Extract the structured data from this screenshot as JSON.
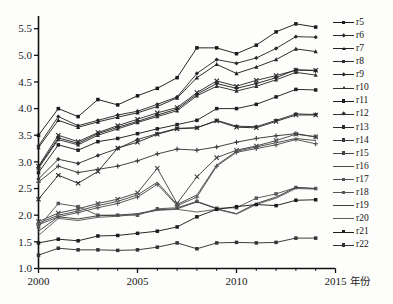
{
  "chart_data": {
    "type": "line",
    "title": "",
    "xlabel": "年份",
    "ylabel": "",
    "xlim": [
      2000,
      2015
    ],
    "ylim": [
      1.0,
      5.7
    ],
    "grid": false,
    "legend_position": "right",
    "x_ticks": [
      2000,
      2005,
      2010,
      2015
    ],
    "x_tick_labels": [
      "2000",
      "2005",
      "2010",
      "2015"
    ],
    "x_minor_ticks": [
      2001,
      2002,
      2003,
      2004,
      2006,
      2007,
      2008,
      2009,
      2011,
      2012,
      2013,
      2014
    ],
    "y_ticks": [
      1.0,
      1.5,
      2.0,
      2.5,
      3.0,
      3.5,
      4.0,
      4.5,
      5.0,
      5.5
    ],
    "y_tick_labels": [
      "1.0",
      "1.5",
      "2.0",
      "2.5",
      "3.0",
      "3.5",
      "4.0",
      "4.5",
      "5.0",
      "5.5"
    ],
    "x": [
      2000,
      2001,
      2002,
      2003,
      2004,
      2005,
      2006,
      2007,
      2008,
      2009,
      2010,
      2011,
      2012,
      2013,
      2014
    ],
    "series": [
      {
        "name": "r5",
        "color": "#1a1a1a",
        "marker": "square",
        "values": [
          3.5,
          4.0,
          3.85,
          4.17,
          4.07,
          4.24,
          4.38,
          4.58,
          5.14,
          5.14,
          5.03,
          5.19,
          5.44,
          5.59,
          5.53
        ]
      },
      {
        "name": "r6",
        "color": "#2b2b2b",
        "marker": "diamond",
        "values": [
          3.3,
          3.85,
          3.68,
          3.78,
          3.88,
          3.95,
          4.08,
          4.22,
          4.66,
          4.92,
          4.85,
          4.95,
          5.13,
          5.35,
          5.34
        ]
      },
      {
        "name": "r7",
        "color": "#232323",
        "marker": "triangle",
        "values": [
          3.27,
          3.78,
          3.65,
          3.75,
          3.84,
          3.92,
          4.04,
          4.2,
          4.58,
          4.83,
          4.66,
          4.78,
          4.92,
          5.12,
          5.07
        ]
      },
      {
        "name": "r8",
        "color": "#2e2e2e",
        "marker": "cross",
        "values": [
          2.92,
          3.5,
          3.38,
          3.55,
          3.68,
          3.8,
          3.92,
          4.02,
          4.3,
          4.52,
          4.42,
          4.53,
          4.62,
          4.72,
          4.72
        ]
      },
      {
        "name": "r9",
        "color": "#262626",
        "marker": "diamond",
        "values": [
          2.9,
          3.45,
          3.35,
          3.53,
          3.65,
          3.76,
          3.88,
          3.99,
          4.27,
          4.47,
          4.38,
          4.47,
          4.58,
          4.73,
          4.71
        ]
      },
      {
        "name": "r10",
        "color": "#303030",
        "marker": "triangle",
        "values": [
          2.88,
          3.42,
          3.32,
          3.5,
          3.62,
          3.74,
          3.85,
          3.96,
          4.24,
          4.42,
          4.33,
          4.42,
          4.54,
          4.68,
          4.63
        ]
      },
      {
        "name": "r11",
        "color": "#1f1f1f",
        "marker": "square",
        "values": [
          2.8,
          3.32,
          3.22,
          3.38,
          3.44,
          3.53,
          3.62,
          3.7,
          3.78,
          4.0,
          4.0,
          4.08,
          4.22,
          4.36,
          4.35
        ]
      },
      {
        "name": "r12",
        "color": "#343434",
        "marker": "diamond",
        "values": [
          2.68,
          3.05,
          2.97,
          3.12,
          3.25,
          3.42,
          3.53,
          3.63,
          3.64,
          3.78,
          3.67,
          3.66,
          3.78,
          3.9,
          3.89
        ]
      },
      {
        "name": "r13",
        "color": "#2a2a2a",
        "marker": "cross",
        "values": [
          2.3,
          2.75,
          2.6,
          2.82,
          3.26,
          3.37,
          3.52,
          3.62,
          3.64,
          3.77,
          3.65,
          3.64,
          3.76,
          3.88,
          3.88
        ]
      },
      {
        "name": "r14",
        "color": "#3a3a3a",
        "marker": "plus",
        "values": [
          2.62,
          2.92,
          2.8,
          2.86,
          2.92,
          3.02,
          3.15,
          3.24,
          3.22,
          3.28,
          3.37,
          3.44,
          3.49,
          3.53,
          3.47
        ]
      },
      {
        "name": "r15",
        "color": "#444444",
        "marker": "cross",
        "values": [
          1.88,
          2.04,
          2.12,
          2.22,
          2.3,
          2.42,
          2.88,
          2.22,
          2.72,
          3.08,
          3.22,
          3.3,
          3.4,
          3.52,
          3.47
        ]
      },
      {
        "name": "r16",
        "color": "#4a4a4a",
        "marker": "none",
        "values": [
          1.85,
          2.0,
          2.08,
          2.18,
          2.26,
          2.38,
          2.62,
          2.2,
          2.38,
          2.94,
          3.2,
          3.28,
          3.36,
          3.44,
          3.4
        ]
      },
      {
        "name": "r17",
        "color": "#505050",
        "marker": "plus",
        "values": [
          1.82,
          1.97,
          2.05,
          2.14,
          2.22,
          2.34,
          2.58,
          2.18,
          2.34,
          2.92,
          3.18,
          3.25,
          3.32,
          3.42,
          3.34
        ]
      },
      {
        "name": "r18",
        "color": "#565656",
        "marker": "square",
        "values": [
          1.78,
          2.22,
          2.16,
          2.0,
          2.0,
          2.0,
          2.12,
          2.14,
          2.26,
          2.13,
          2.14,
          2.32,
          2.4,
          2.52,
          2.5
        ]
      },
      {
        "name": "r19",
        "color": "#3d3d3d",
        "marker": "none",
        "values": [
          1.7,
          1.97,
          1.93,
          1.99,
          2.0,
          2.03,
          2.1,
          2.12,
          2.25,
          2.12,
          2.03,
          2.22,
          2.34,
          2.52,
          2.5
        ]
      },
      {
        "name": "r20",
        "color": "#5c5c5c",
        "marker": "none",
        "values": [
          1.62,
          1.94,
          1.9,
          1.96,
          1.98,
          2.02,
          2.09,
          2.11,
          2.06,
          2.11,
          2.02,
          2.2,
          2.32,
          2.5,
          2.49
        ]
      },
      {
        "name": "r21",
        "color": "#1c1c1c",
        "marker": "square",
        "values": [
          1.48,
          1.55,
          1.52,
          1.61,
          1.62,
          1.66,
          1.7,
          1.78,
          1.97,
          2.11,
          2.16,
          2.2,
          2.18,
          2.28,
          2.29
        ]
      },
      {
        "name": "r22",
        "color": "#333333",
        "marker": "square",
        "values": [
          1.25,
          1.38,
          1.35,
          1.35,
          1.34,
          1.35,
          1.4,
          1.48,
          1.37,
          1.48,
          1.49,
          1.48,
          1.49,
          1.57,
          1.57
        ]
      }
    ]
  },
  "legend": {
    "items": [
      {
        "label": "r5"
      },
      {
        "label": "r6"
      },
      {
        "label": "r7"
      },
      {
        "label": "r8"
      },
      {
        "label": "r9"
      },
      {
        "label": "r10"
      },
      {
        "label": "r11"
      },
      {
        "label": "r12"
      },
      {
        "label": "r13"
      },
      {
        "label": "r14"
      },
      {
        "label": "r15"
      },
      {
        "label": "r16"
      },
      {
        "label": "r17"
      },
      {
        "label": "r18"
      },
      {
        "label": "r19"
      },
      {
        "label": "r20"
      },
      {
        "label": "r21"
      },
      {
        "label": "r22"
      }
    ]
  }
}
